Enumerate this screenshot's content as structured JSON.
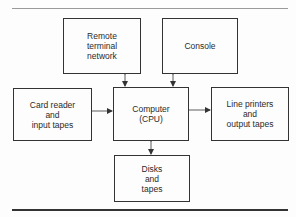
{
  "diagram": {
    "nodes": {
      "remote": "Remote\nterminal\nnetwork",
      "console": "Console",
      "card_reader": "Card reader\nand\ninput tapes",
      "computer": "Computer\n(CPU)",
      "line_printers": "Line printers\nand\noutput tapes",
      "disks": "Disks\nand\ntapes"
    },
    "edges": [
      {
        "from": "remote",
        "to": "computer",
        "direction": "bidirectional"
      },
      {
        "from": "console",
        "to": "computer",
        "direction": "bidirectional"
      },
      {
        "from": "card_reader",
        "to": "computer",
        "direction": "forward"
      },
      {
        "from": "computer",
        "to": "line_printers",
        "direction": "forward"
      },
      {
        "from": "computer",
        "to": "disks",
        "direction": "bidirectional"
      }
    ]
  }
}
